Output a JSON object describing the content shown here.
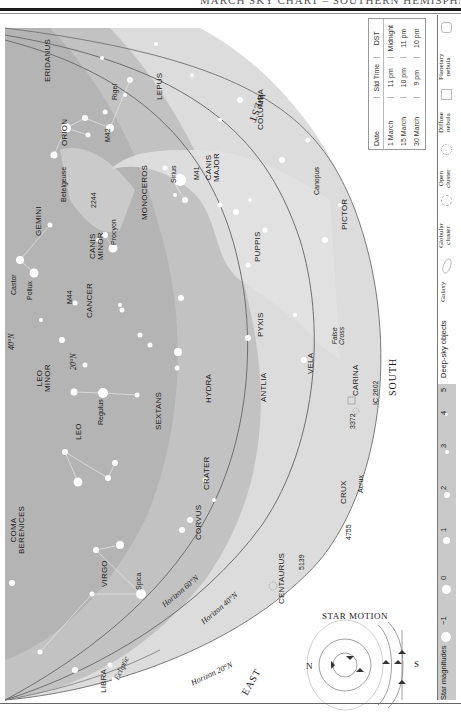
{
  "page": {
    "header_text": "MARCH SKY CHART – SOUTHERN HEMISPHERE",
    "orientation": "rotated-90-ccw"
  },
  "colors": {
    "sky_dark": "#a9a9a9",
    "sky_mid": "#c2c2c2",
    "sky_light": "#dcdcdc",
    "milky_way": "#e4e4e4",
    "horizon_line": "#6f6f6f",
    "legend_bar": "#c9c9c9",
    "ink": "#1a1a1a"
  },
  "directions": {
    "west": "WEST",
    "south": "SOUTH",
    "east": "EAST"
  },
  "horizons": {
    "h20": "Horizon 20°N",
    "h40": "Horizon 40°N",
    "h60": "Horizon 60°N",
    "ecliptic": "Ecliptic"
  },
  "latitude_marks": {
    "n40": "40°N",
    "n20": "20°N"
  },
  "constellations": [
    {
      "id": "eridanus",
      "label": "ERIDANUS"
    },
    {
      "id": "lepus",
      "label": "LEPUS"
    },
    {
      "id": "orion",
      "label": "ORION"
    },
    {
      "id": "columba",
      "label": "COLUMBA"
    },
    {
      "id": "monoceros",
      "label": "MONOCEROS"
    },
    {
      "id": "gemini",
      "label": "GEMINI"
    },
    {
      "id": "canis-major",
      "label": "CANIS\nMAJOR"
    },
    {
      "id": "canis-minor",
      "label": "CANIS\nMINOR"
    },
    {
      "id": "pictor",
      "label": "PICTOR"
    },
    {
      "id": "puppis",
      "label": "PUPPIS"
    },
    {
      "id": "cancer",
      "label": "CANCER"
    },
    {
      "id": "leo-minor",
      "label": "LEO\nMINOR"
    },
    {
      "id": "leo",
      "label": "LEO"
    },
    {
      "id": "sextans",
      "label": "SEXTANS"
    },
    {
      "id": "hydra",
      "label": "HYDRA"
    },
    {
      "id": "pyxis",
      "label": "PYXIS"
    },
    {
      "id": "antlia",
      "label": "ANTLIA"
    },
    {
      "id": "vela",
      "label": "VELA"
    },
    {
      "id": "carina",
      "label": "CARINA"
    },
    {
      "id": "crater",
      "label": "CRATER"
    },
    {
      "id": "corvus",
      "label": "CORVUS"
    },
    {
      "id": "coma-berenices",
      "label": "COMA\nBERENICES"
    },
    {
      "id": "virgo",
      "label": "VIRGO"
    },
    {
      "id": "centaurus",
      "label": "CENTAURUS"
    },
    {
      "id": "crux",
      "label": "CRUX"
    },
    {
      "id": "libra",
      "label": "LIBRA"
    }
  ],
  "stars": [
    {
      "id": "rigel",
      "label": "Rigel"
    },
    {
      "id": "betelgeuse",
      "label": "Betelgeuse"
    },
    {
      "id": "sirius",
      "label": "Sirius"
    },
    {
      "id": "procyon",
      "label": "Procyon"
    },
    {
      "id": "canopus",
      "label": "Canopus"
    },
    {
      "id": "castor",
      "label": "Castor"
    },
    {
      "id": "pollux",
      "label": "Pollux"
    },
    {
      "id": "regulus",
      "label": "Regulus"
    },
    {
      "id": "spica",
      "label": "Spica"
    },
    {
      "id": "acrux",
      "label": "Acrux"
    }
  ],
  "objects": [
    {
      "id": "m42",
      "label": "M42"
    },
    {
      "id": "m41",
      "label": "M41"
    },
    {
      "id": "ngc2244",
      "label": "2244"
    },
    {
      "id": "m44",
      "label": "M44"
    },
    {
      "id": "ngc3372",
      "label": "3372"
    },
    {
      "id": "ic2602",
      "label": "IC 2602"
    },
    {
      "id": "ngc4755",
      "label": "4755"
    },
    {
      "id": "ngc5139",
      "label": "5139"
    },
    {
      "id": "false-cross",
      "label": "False\nCross"
    }
  ],
  "time_table": {
    "headers": [
      "Date",
      "Std Time",
      "DST"
    ],
    "rows": [
      [
        "1 March",
        "11 pm",
        "Midnight"
      ],
      [
        "15 March",
        "10 pm",
        "11 pm"
      ],
      [
        "30 March",
        "9 pm",
        "10 pm"
      ]
    ]
  },
  "star_motion": {
    "title": "Star Motion",
    "north": "N",
    "south": "S"
  },
  "legend": {
    "magnitudes_label": "Star magnitudes",
    "magnitudes": [
      "−1",
      "0",
      "1",
      "2",
      "3",
      "4",
      "5"
    ],
    "deep_sky_label": "Deep-sky objects",
    "deep_sky": [
      {
        "id": "galaxy",
        "label": "Galaxy"
      },
      {
        "id": "globular-cluster",
        "label": "Globular\ncluster"
      },
      {
        "id": "open-cluster",
        "label": "Open\ncluster"
      },
      {
        "id": "diffuse-nebula",
        "label": "Diffuse\nnebula"
      },
      {
        "id": "planetary-nebula",
        "label": "Planetary\nnebula"
      }
    ]
  }
}
